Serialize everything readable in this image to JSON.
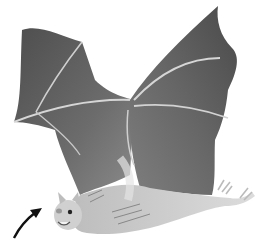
{
  "image": {
    "subject": "bat in flight illustration",
    "style": "grayscale painted illustration",
    "annotation": "arrow pointing to bat head",
    "colors": {
      "background": "#ffffff",
      "wing_dark": "#5a5a5a",
      "wing_mid": "#7a7a7a",
      "wing_bone": "#d8d8d8",
      "body": "#c8c8c8",
      "belly": "#e2e2e2",
      "arrow": "#111111"
    }
  }
}
